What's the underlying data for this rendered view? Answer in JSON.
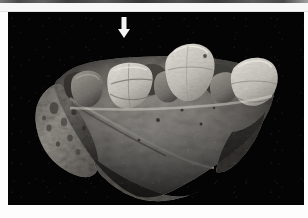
{
  "figure": {
    "kind": "photograph",
    "background_color": "#040404",
    "page_color": "#fdfdfd",
    "caption": ""
  },
  "scan_artifact": {
    "name": "scanner-edge-strip",
    "position": "top",
    "height_px": 3,
    "color": "#3a3a3a"
  },
  "plate": {
    "x": 8,
    "y": 12,
    "width": 296,
    "height": 193
  },
  "annotations": [
    {
      "name": "pointer-arrow",
      "glyph": "downward-arrow",
      "color": "#f4f4f4",
      "x": 124,
      "y": 38,
      "points_to": "second-tooth-from-left",
      "label": ""
    }
  ],
  "specimen": {
    "name": "maxilla-fragment",
    "bone_color_light": "#c9c6bf",
    "bone_color_mid": "#9a968f",
    "bone_color_dark": "#4e4b47",
    "teeth": [
      {
        "name": "tooth-1-left",
        "label": "",
        "cx": 78,
        "cy": 78,
        "rx": 13,
        "ry": 16,
        "shade": "#7d7a74"
      },
      {
        "name": "tooth-2-arrowed",
        "label": "",
        "cx": 122,
        "cy": 74,
        "rx": 19,
        "ry": 21,
        "shade": "#cfccc5"
      },
      {
        "name": "tooth-3-middle",
        "label": "",
        "cx": 160,
        "cy": 79,
        "rx": 12,
        "ry": 15,
        "shade": "#6f6c67"
      },
      {
        "name": "tooth-4-tall",
        "label": "",
        "cx": 180,
        "cy": 62,
        "rx": 21,
        "ry": 26,
        "shade": "#d6d3cc"
      },
      {
        "name": "tooth-5-right",
        "label": "",
        "cx": 215,
        "cy": 78,
        "rx": 13,
        "ry": 15,
        "shade": "#6a6762"
      },
      {
        "name": "tooth-6-far-right",
        "label": "",
        "cx": 245,
        "cy": 72,
        "rx": 21,
        "ry": 22,
        "shade": "#cbc8c1"
      }
    ]
  }
}
